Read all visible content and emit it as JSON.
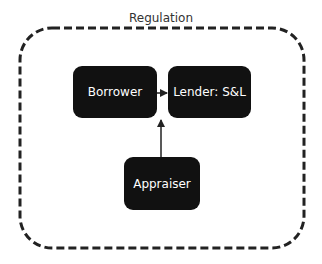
{
  "diagram": {
    "container": {
      "label": "Regulation",
      "border_style": "dashed",
      "border_color": "#222222"
    },
    "nodes": [
      {
        "id": "borrower",
        "label": "Borrower"
      },
      {
        "id": "lender",
        "label": "Lender: S&L"
      },
      {
        "id": "appraiser",
        "label": "Appraiser"
      }
    ],
    "edges": [
      {
        "from": "borrower",
        "to": "lender"
      },
      {
        "from": "appraiser",
        "to": "lender"
      }
    ],
    "colors": {
      "node_fill": "#111111",
      "node_text": "#ffffff",
      "edge": "#222222"
    }
  }
}
